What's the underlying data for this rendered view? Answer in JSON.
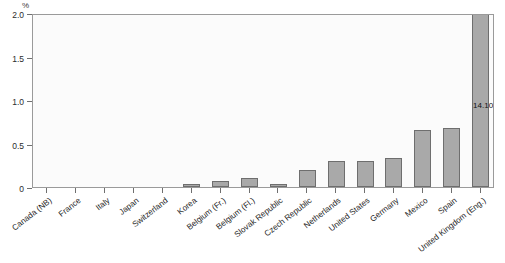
{
  "chart_data": {
    "type": "bar",
    "title": "",
    "subtitle": "",
    "xlabel": "",
    "ylabel": "%",
    "ylim": [
      0,
      2.0
    ],
    "yticks": [
      "0",
      "0.5",
      "1.0",
      "1.5",
      "2.0"
    ],
    "ytick_values": [
      0,
      0.5,
      1.0,
      1.5,
      2.0
    ],
    "grid": false,
    "legend": null,
    "categories": [
      "Canada (NB)",
      "France",
      "Italy",
      "Japan",
      "Switzerland",
      "Korea",
      "Belgium (Fr.)",
      "Belgium (Fl.)",
      "Slovak Republic",
      "Czech Republic",
      "Netherlands",
      "United States",
      "Germany",
      "Mexico",
      "Spain",
      "United Kingdom (Eng.)"
    ],
    "values": [
      0.0,
      0.0,
      0.0,
      0.0,
      0.0,
      0.03,
      0.07,
      0.1,
      0.03,
      0.19,
      0.3,
      0.3,
      0.33,
      0.65,
      0.68,
      14.1
    ],
    "annotations": [
      {
        "category": "United Kingdom (Eng.)",
        "label": "14.10",
        "note": "bar clipped at axis maximum"
      }
    ],
    "bar_color": "#a9a9a9",
    "bar_edge_color": "#6e6e6e",
    "plot_background": "#fbfbfb",
    "frame_color": "#9a9a9a"
  },
  "axis": {
    "unit_symbol": "%"
  }
}
